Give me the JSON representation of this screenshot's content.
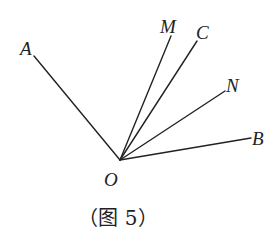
{
  "figure": {
    "caption": "（图 5）",
    "vertex": {
      "label": "O"
    },
    "rays": [
      {
        "label": "A"
      },
      {
        "label": "M"
      },
      {
        "label": "C"
      },
      {
        "label": "N"
      },
      {
        "label": "B"
      }
    ],
    "stroke_color": "#222222",
    "background": "#ffffff"
  }
}
